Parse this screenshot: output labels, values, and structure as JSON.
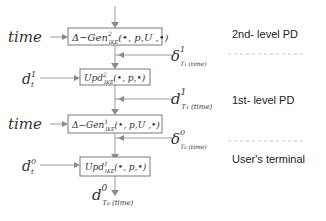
{
  "diagram": {
    "boxes": [
      {
        "id": "gen2",
        "label": "Δ−Gen",
        "sup": "2",
        "sub": "IKE",
        "args": "(•, p,U ,•)"
      },
      {
        "id": "upd2",
        "label": "Upd",
        "sup": "2",
        "sub": "IKE",
        "args": "(•, p,•)"
      },
      {
        "id": "gen1",
        "label": "Δ−Gen",
        "sup": "1",
        "sub": "IKE",
        "args": "(•, p,U ,•)"
      },
      {
        "id": "upd1",
        "label": "Upd",
        "sup": "1",
        "sub": "IKE",
        "args": "(•, p,•)"
      }
    ],
    "inputs": [
      {
        "id": "time-1",
        "label": "time"
      },
      {
        "id": "d1t",
        "label": "d",
        "sup": "1",
        "sub": "t"
      },
      {
        "id": "time-2",
        "label": "time"
      },
      {
        "id": "d0t",
        "label": "d",
        "sup": "0",
        "sub": "t"
      }
    ],
    "side_inputs": [
      {
        "id": "delta1",
        "label": "δ",
        "sup": "1",
        "sub": "T₁ (time)"
      },
      {
        "id": "d1T",
        "label": "d",
        "sup": "1",
        "sub": "T₁ (time)"
      },
      {
        "id": "delta0",
        "label": "δ",
        "sup": "0",
        "sub": "T₀ (time)"
      }
    ],
    "output": {
      "label": "d",
      "sup": "0",
      "sub": "T₀ (time)"
    },
    "levels": [
      {
        "label": "2nd- level PD"
      },
      {
        "label": "1st- level PD"
      },
      {
        "label": "User's terminal"
      }
    ]
  }
}
